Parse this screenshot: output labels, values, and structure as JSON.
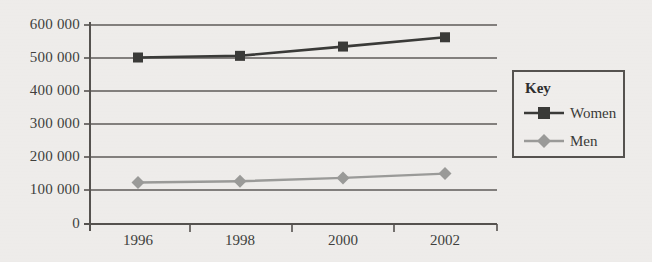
{
  "chart_data": {
    "type": "line",
    "title": "",
    "subtitle": "",
    "xlabel": "",
    "ylabel": "",
    "categories": [
      "1996",
      "1998",
      "2000",
      "2002"
    ],
    "series": [
      {
        "name": "Women",
        "color": "#3a3a38",
        "marker": "square",
        "values": [
          502000,
          507000,
          535000,
          563000
        ]
      },
      {
        "name": "Men",
        "color": "#9a9a98",
        "marker": "diamond",
        "values": [
          125000,
          129000,
          139000,
          152000
        ]
      }
    ],
    "ylim": [
      0,
      600000
    ],
    "ytick_values": [
      600000,
      500000,
      400000,
      300000,
      200000,
      100000,
      0
    ],
    "ytick_labels": [
      "600 000",
      "500 000",
      "400 000",
      "300 000",
      "200 000",
      "100 000",
      "0"
    ],
    "grid": true,
    "grid_axis": "y",
    "legend_position": "right-outside"
  },
  "legend": {
    "title": "Key",
    "entries": [
      {
        "label": "Women",
        "marker": "square-marker",
        "color": "#3a3a38"
      },
      {
        "label": "Men",
        "marker": "diamond-marker",
        "color": "#9a9a98"
      }
    ]
  },
  "colors": {
    "background": "#eeecea",
    "axis": "#55524f",
    "gridline": "#5e5b58",
    "women": "#3a3a38",
    "men": "#9a9a98",
    "text": "#403f3d"
  }
}
